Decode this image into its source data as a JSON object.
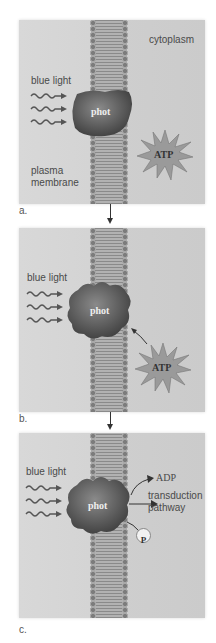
{
  "figure": {
    "panels": [
      {
        "id": "a",
        "label": "a.",
        "blue_light": "blue light",
        "protein": "phot",
        "cytoplasm": "cytoplasm",
        "plasma_membrane_line1": "plasma",
        "plasma_membrane_line2": "membrane",
        "atp": "ATP"
      },
      {
        "id": "b",
        "label": "b.",
        "blue_light": "blue light",
        "protein": "phot",
        "atp": "ATP"
      },
      {
        "id": "c",
        "label": "c.",
        "blue_light": "blue light",
        "protein": "phot",
        "adp": "ADP",
        "transduction_line1": "transduction",
        "transduction_line2": "pathway",
        "phosphate": "P"
      }
    ],
    "colors": {
      "background": "#d4d4d4",
      "protein": "#5e5e5e",
      "membrane": "#9a9a9a",
      "text": "#4a4a4a"
    }
  }
}
